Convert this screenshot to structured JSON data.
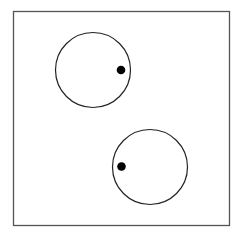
{
  "diagram": {
    "canvas": {
      "width": 246,
      "height": 237,
      "background": "#ffffff"
    },
    "frame": {
      "x": 13.5,
      "y": 11.5,
      "width": 216,
      "height": 214,
      "stroke": "#555555",
      "stroke_width": 1.3
    },
    "circles": [
      {
        "id": "circle-1",
        "cx": 93,
        "cy": 70,
        "r": 37.5,
        "stroke": "#222222",
        "stroke_width": 1.2,
        "dot": {
          "cx": 121,
          "cy": 70,
          "r": 4.3,
          "fill": "#000000"
        }
      },
      {
        "id": "circle-2",
        "cx": 150,
        "cy": 167,
        "r": 37.5,
        "stroke": "#222222",
        "stroke_width": 1.2,
        "dot": {
          "cx": 121.5,
          "cy": 166.5,
          "r": 4.3,
          "fill": "#000000"
        }
      }
    ]
  }
}
